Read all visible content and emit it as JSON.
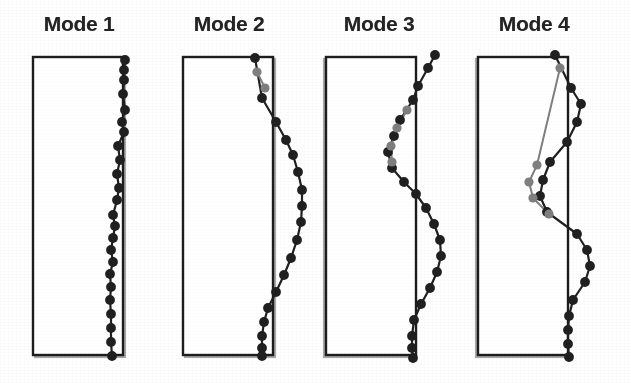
{
  "figure": {
    "title": "",
    "background_color": "#ffffff",
    "width": 631,
    "height": 383
  },
  "colors": {
    "outline_dark": "#1a1a1a",
    "outline_light": "#9b9b9b",
    "marker_dark": "#222222",
    "marker_gray": "#7f7f7f",
    "line_dark": "#222222",
    "line_gray": "#8a8a8a",
    "title_text": "#262626"
  },
  "panels": [
    {
      "id": "mode-1",
      "title": "Mode 1",
      "panel_left": 0,
      "building": {
        "x": 33,
        "y": 57,
        "width": 90,
        "height": 298
      }
    },
    {
      "id": "mode-2",
      "title": "Mode 2",
      "panel_left": 150,
      "building": {
        "x": 33,
        "y": 57,
        "width": 90,
        "height": 298
      }
    },
    {
      "id": "mode-3",
      "title": "Mode 3",
      "panel_left": 300,
      "building": {
        "x": 26,
        "y": 57,
        "width": 90,
        "height": 298
      }
    },
    {
      "id": "mode-4",
      "title": "Mode 4",
      "panel_left": 455,
      "building": {
        "x": 23,
        "y": 57,
        "width": 90,
        "height": 298
      }
    }
  ],
  "chart_data": {
    "type": "line",
    "xlabel": "Normalized modal amplitude",
    "ylabel": "Height (storey)",
    "grid": false,
    "legend": "none",
    "series": [
      {
        "panel": "mode-1",
        "name": "Mode 1 dark markers",
        "color": "#222222",
        "points": [
          {
            "x": 125,
            "y": 60
          },
          {
            "x": 124,
            "y": 70
          },
          {
            "x": 124,
            "y": 80
          },
          {
            "x": 123,
            "y": 94
          },
          {
            "x": 125,
            "y": 110
          },
          {
            "x": 122,
            "y": 122
          },
          {
            "x": 124,
            "y": 132
          },
          {
            "x": 118,
            "y": 146
          },
          {
            "x": 120,
            "y": 160
          },
          {
            "x": 117,
            "y": 174
          },
          {
            "x": 119,
            "y": 188
          },
          {
            "x": 117,
            "y": 200
          },
          {
            "x": 113,
            "y": 215
          },
          {
            "x": 115,
            "y": 226
          },
          {
            "x": 113,
            "y": 238
          },
          {
            "x": 111,
            "y": 250
          },
          {
            "x": 113,
            "y": 262
          },
          {
            "x": 110,
            "y": 274
          },
          {
            "x": 111,
            "y": 287
          },
          {
            "x": 110,
            "y": 300
          },
          {
            "x": 111,
            "y": 314
          },
          {
            "x": 111,
            "y": 328
          },
          {
            "x": 111,
            "y": 342
          },
          {
            "x": 112,
            "y": 356
          }
        ]
      },
      {
        "panel": "mode-2",
        "name": "Mode 2 dark markers",
        "color": "#222222",
        "points": [
          {
            "x": 105,
            "y": 58
          },
          {
            "x": 112,
            "y": 98
          },
          {
            "x": 126,
            "y": 122
          },
          {
            "x": 136,
            "y": 140
          },
          {
            "x": 143,
            "y": 155
          },
          {
            "x": 148,
            "y": 172
          },
          {
            "x": 152,
            "y": 190
          },
          {
            "x": 152,
            "y": 206
          },
          {
            "x": 151,
            "y": 222
          },
          {
            "x": 147,
            "y": 240
          },
          {
            "x": 141,
            "y": 258
          },
          {
            "x": 134,
            "y": 275
          },
          {
            "x": 126,
            "y": 292
          },
          {
            "x": 118,
            "y": 308
          },
          {
            "x": 114,
            "y": 322
          },
          {
            "x": 112,
            "y": 336
          },
          {
            "x": 112,
            "y": 348
          },
          {
            "x": 112,
            "y": 356
          }
        ]
      },
      {
        "panel": "mode-2",
        "name": "Mode 2 gray markers",
        "color": "#7f7f7f",
        "points": [
          {
            "x": 107,
            "y": 72
          },
          {
            "x": 115,
            "y": 88
          }
        ]
      },
      {
        "panel": "mode-3",
        "name": "Mode 3 dark markers",
        "color": "#222222",
        "points": [
          {
            "x": 135,
            "y": 55
          },
          {
            "x": 128,
            "y": 68
          },
          {
            "x": 118,
            "y": 86
          },
          {
            "x": 113,
            "y": 100
          },
          {
            "x": 100,
            "y": 120
          },
          {
            "x": 94,
            "y": 136
          },
          {
            "x": 88,
            "y": 152
          },
          {
            "x": 92,
            "y": 168
          },
          {
            "x": 104,
            "y": 182
          },
          {
            "x": 116,
            "y": 194
          },
          {
            "x": 126,
            "y": 208
          },
          {
            "x": 134,
            "y": 224
          },
          {
            "x": 140,
            "y": 240
          },
          {
            "x": 141,
            "y": 256
          },
          {
            "x": 137,
            "y": 272
          },
          {
            "x": 130,
            "y": 288
          },
          {
            "x": 121,
            "y": 304
          },
          {
            "x": 114,
            "y": 320
          },
          {
            "x": 112,
            "y": 336
          },
          {
            "x": 112,
            "y": 348
          },
          {
            "x": 113,
            "y": 358
          }
        ]
      },
      {
        "panel": "mode-3",
        "name": "Mode 3 gray markers",
        "color": "#7f7f7f",
        "points": [
          {
            "x": 107,
            "y": 110
          },
          {
            "x": 97,
            "y": 128
          },
          {
            "x": 91,
            "y": 146
          },
          {
            "x": 92,
            "y": 162
          }
        ]
      },
      {
        "panel": "mode-4",
        "name": "Mode 4 dark markers",
        "color": "#222222",
        "points": [
          {
            "x": 100,
            "y": 55
          },
          {
            "x": 116,
            "y": 88
          },
          {
            "x": 126,
            "y": 104
          },
          {
            "x": 122,
            "y": 122
          },
          {
            "x": 112,
            "y": 142
          },
          {
            "x": 95,
            "y": 162
          },
          {
            "x": 88,
            "y": 180
          },
          {
            "x": 85,
            "y": 196
          },
          {
            "x": 92,
            "y": 212
          },
          {
            "x": 122,
            "y": 234
          },
          {
            "x": 132,
            "y": 250
          },
          {
            "x": 135,
            "y": 266
          },
          {
            "x": 130,
            "y": 282
          },
          {
            "x": 118,
            "y": 300
          },
          {
            "x": 114,
            "y": 316
          },
          {
            "x": 113,
            "y": 330
          },
          {
            "x": 113,
            "y": 344
          },
          {
            "x": 114,
            "y": 357
          }
        ]
      },
      {
        "panel": "mode-4",
        "name": "Mode 4 gray markers",
        "color": "#7f7f7f",
        "points": [
          {
            "x": 105,
            "y": 68
          },
          {
            "x": 82,
            "y": 165
          },
          {
            "x": 74,
            "y": 182
          },
          {
            "x": 78,
            "y": 198
          },
          {
            "x": 94,
            "y": 214
          }
        ]
      }
    ]
  }
}
